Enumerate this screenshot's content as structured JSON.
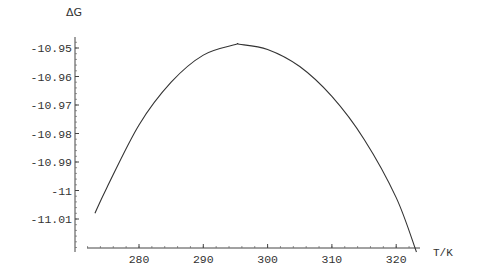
{
  "chart_data": {
    "type": "line",
    "title": "",
    "xlabel": "T/K",
    "ylabel": "ΔG",
    "xlim": [
      271.8,
      323.5
    ],
    "ylim": [
      -11.0216,
      -10.946
    ],
    "x_ticks": [
      280,
      290,
      300,
      310,
      320
    ],
    "x_tick_labels": [
      "280",
      "290",
      "300",
      "310",
      "320"
    ],
    "y_ticks": [
      -10.95,
      -10.96,
      -10.97,
      -10.98,
      -10.99,
      -11.0,
      -11.01
    ],
    "y_tick_labels": [
      "-10.95",
      "-10.96",
      "-10.97",
      "-10.98",
      "-10.99",
      "-11",
      "-11.01"
    ],
    "grid": false,
    "series": [
      {
        "name": "ΔG(T)",
        "color": "#333333",
        "x": [
          273.15,
          275,
          280,
          285,
          290,
          295,
          295.6,
          300,
          305,
          310,
          315,
          320,
          323.15
        ],
        "y": [
          -11.008,
          -10.999,
          -10.977,
          -10.962,
          -10.9525,
          -10.9488,
          -10.9487,
          -10.9505,
          -10.9565,
          -10.967,
          -10.982,
          -11.0025,
          -11.0216
        ]
      }
    ]
  }
}
